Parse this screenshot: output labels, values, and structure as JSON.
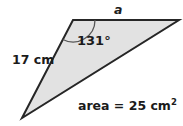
{
  "figure": {
    "type": "geometry-diagram",
    "shape": "triangle",
    "canvas": {
      "width": 183,
      "height": 126,
      "background": "#ffffff"
    },
    "style": {
      "fill": "#e2e2e2",
      "stroke": "#262626",
      "stroke_width": 2,
      "arc_stroke": "#555555",
      "text_color": "#1b1b1b"
    },
    "vertices": [
      {
        "name": "apex-top-left",
        "x": 73,
        "y": 20
      },
      {
        "name": "vertex-right",
        "x": 179,
        "y": 20
      },
      {
        "name": "vertex-bottom-left",
        "x": 22,
        "y": 118
      }
    ],
    "labels": {
      "side_a": "a",
      "side_left": "17 cm",
      "angle": "131°",
      "area_text": "area = 25 cm",
      "area_exponent": "2"
    },
    "given_values": {
      "angle_degrees": 131,
      "side_left_length": "17 cm",
      "area": "25 cm²",
      "unknown_side": "a"
    }
  }
}
